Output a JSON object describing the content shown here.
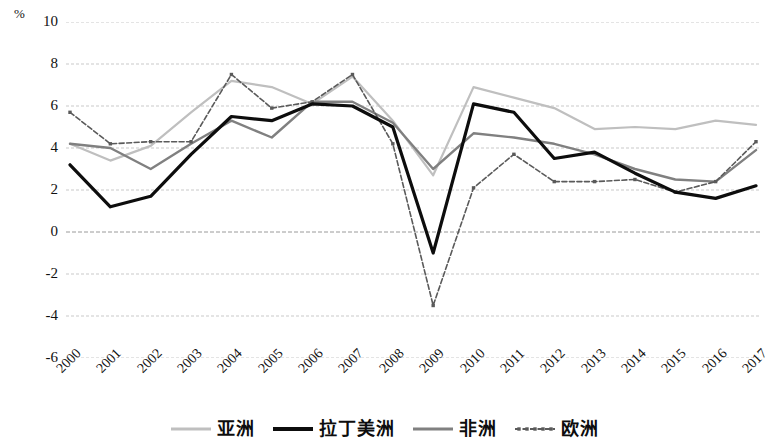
{
  "chart_data": {
    "type": "line",
    "title": "",
    "subtitle": "",
    "xlabel": "",
    "ylabel": "%",
    "unit_label": "%",
    "x": [
      "2000",
      "2001",
      "2002",
      "2003",
      "2004",
      "2005",
      "2006",
      "2007",
      "2008",
      "2009",
      "2010",
      "2011",
      "2012",
      "2013",
      "2014",
      "2015",
      "2016",
      "2017"
    ],
    "categories": [
      "2000",
      "2001",
      "2002",
      "2003",
      "2004",
      "2005",
      "2006",
      "2007",
      "2008",
      "2009",
      "2010",
      "2011",
      "2012",
      "2013",
      "2014",
      "2015",
      "2016",
      "2017"
    ],
    "ylim": [
      -6,
      10
    ],
    "yticks": [
      "10",
      "8",
      "6",
      "4",
      "2",
      "0",
      "-2",
      "-4",
      "-6"
    ],
    "ytick_values": [
      10,
      8,
      6,
      4,
      2,
      0,
      -2,
      -4,
      -6
    ],
    "grid": true,
    "grid_axis": "y",
    "legend_position": "bottom",
    "series": [
      {
        "name": "亚洲",
        "color": "#bfbfbf",
        "style": "solid",
        "width": 2.2,
        "markers": false,
        "values": [
          4.2,
          3.4,
          4.1,
          5.7,
          7.2,
          6.9,
          6.1,
          7.4,
          5.3,
          2.7,
          6.9,
          6.4,
          5.9,
          4.9,
          5.0,
          4.9,
          5.3,
          5.1
        ]
      },
      {
        "name": "拉丁美洲",
        "color": "#0d0d0d",
        "style": "solid",
        "width": 3.2,
        "markers": false,
        "values": [
          3.2,
          1.2,
          1.7,
          3.7,
          5.5,
          5.3,
          6.1,
          6.0,
          5.0,
          -1.0,
          6.1,
          5.7,
          3.5,
          3.8,
          2.8,
          1.9,
          1.6,
          2.2
        ]
      },
      {
        "name": "非洲",
        "color": "#808080",
        "style": "solid",
        "width": 2.4,
        "markers": false,
        "values": [
          4.2,
          4.0,
          3.0,
          4.2,
          5.3,
          4.5,
          6.2,
          6.2,
          5.2,
          3.0,
          4.7,
          4.5,
          4.2,
          3.7,
          3.0,
          2.5,
          2.4,
          3.9
        ]
      },
      {
        "name": "欧洲",
        "color": "#5a5a5a",
        "style": "dashed-markers",
        "width": 1.6,
        "markers": true,
        "values": [
          5.7,
          4.2,
          4.3,
          4.3,
          7.5,
          5.9,
          6.2,
          7.5,
          4.2,
          -3.5,
          2.1,
          3.7,
          2.4,
          2.4,
          2.5,
          1.9,
          2.4,
          4.3
        ]
      }
    ]
  },
  "legend": {
    "items": [
      {
        "label": "亚洲",
        "key": "asia"
      },
      {
        "label": "拉丁美洲",
        "key": "latin-america"
      },
      {
        "label": "非洲",
        "key": "africa"
      },
      {
        "label": "欧洲",
        "key": "europe"
      }
    ]
  }
}
